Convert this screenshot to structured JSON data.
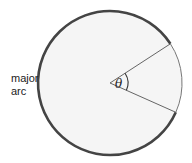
{
  "diagram": {
    "type": "circle-sector",
    "labels": {
      "major_arc_line1": "major",
      "major_arc_line2": "arc",
      "angle": "θ"
    },
    "geometry": {
      "center": [
        110,
        83
      ],
      "radius": 72,
      "sector_start_deg": -33,
      "sector_end_deg": 24
    },
    "colors": {
      "stroke": "#444444",
      "fill": "#f5f5f5",
      "minor_arc": "#777777",
      "text": "#222222"
    }
  }
}
